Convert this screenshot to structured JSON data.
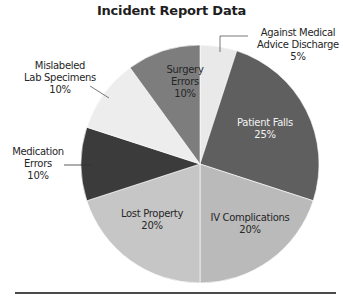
{
  "chart_data": {
    "type": "pie",
    "title": "Incident Report Data",
    "categories": [
      "Against Medical Advice Discharge",
      "Patient Falls",
      "IV Complications",
      "Lost Property",
      "Medication Errors",
      "Mislabeled Lab Specimens",
      "Surgery Errors"
    ],
    "values": [
      5,
      25,
      20,
      20,
      10,
      10,
      10
    ],
    "value_labels": [
      "5%",
      "25%",
      "20%",
      "20%",
      "10%",
      "10%",
      "10%"
    ],
    "colors": [
      "#e9e9e9",
      "#5f5f5f",
      "#bababa",
      "#c6c6c6",
      "#3b3b3b",
      "#ededed",
      "#7d7d7d"
    ],
    "start_angle_deg": 0,
    "direction": "clockwise",
    "legend": "none (direct labels)"
  },
  "labels": {
    "ama_line1": "Against  Medical",
    "ama_line2": "Advice Discharge",
    "ama_pct": "5%",
    "falls_name": "Patient Falls",
    "falls_pct": "25%",
    "iv_name": "IV Complications",
    "iv_pct": "20%",
    "lost_name": "Lost Property",
    "lost_pct": "20%",
    "med_line1": "Medication",
    "med_line2": "Errors",
    "med_pct": "10%",
    "mis_line1": "Mislabeled",
    "mis_line2": "Lab Specimens",
    "mis_pct": "10%",
    "surg_line1": "Surgery",
    "surg_line2": "Errors",
    "surg_pct": "10%"
  }
}
